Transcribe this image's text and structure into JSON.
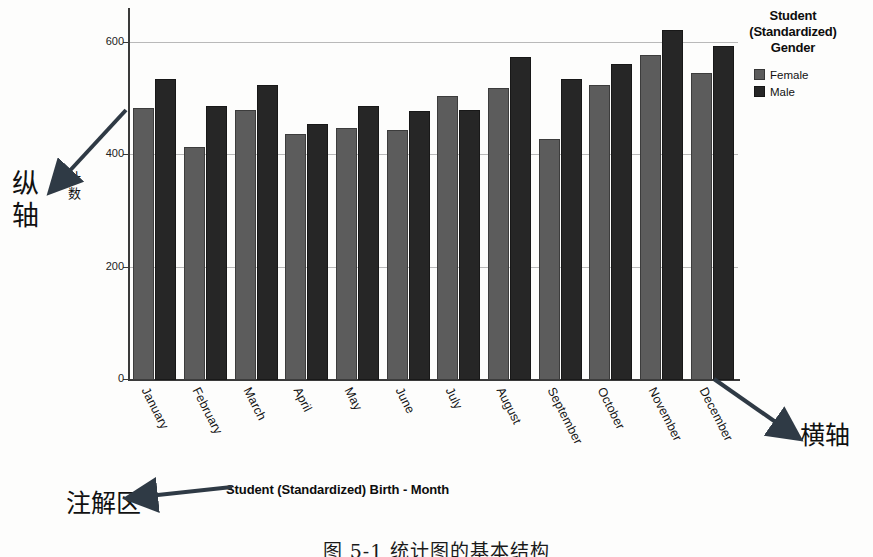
{
  "chart_data": {
    "type": "bar",
    "title": "",
    "xlabel": "Student (Standardized) Birth - Month",
    "ylabel": "计数",
    "categories": [
      "January",
      "February",
      "March",
      "April",
      "May",
      "June",
      "July",
      "August",
      "September",
      "October",
      "November",
      "December"
    ],
    "series": [
      {
        "name": "Female",
        "color": "#5c5c5c",
        "values": [
          484,
          415,
          481,
          438,
          448,
          444,
          506,
          519,
          428,
          524,
          578,
          547
        ]
      },
      {
        "name": "Male",
        "color": "#262626",
        "values": [
          535,
          487,
          524,
          455,
          487,
          478,
          480,
          575,
          535,
          563,
          622,
          594
        ]
      }
    ],
    "yticks": [
      0,
      200,
      400,
      600
    ],
    "ylim": [
      0,
      660
    ],
    "grid": true,
    "legend_position": "right",
    "legend_title": "Student (Standardized) Gender"
  },
  "legend": {
    "title_lines": [
      "Student",
      "(Standardized)",
      "Gender"
    ],
    "entries": [
      {
        "label": "Female",
        "color": "#5c5c5c"
      },
      {
        "label": "Male",
        "color": "#262626"
      }
    ]
  },
  "annotations": {
    "y_axis_note": "纵轴",
    "x_axis_note": "横轴",
    "legend_note": "注解区"
  },
  "caption": "图 5-1  统计图的基本结构",
  "colors": {
    "female": "#5c5c5c",
    "male": "#262626",
    "grid": "#b9b9b9",
    "axis": "#3a3a3a",
    "arrow": "#2f3a45"
  }
}
